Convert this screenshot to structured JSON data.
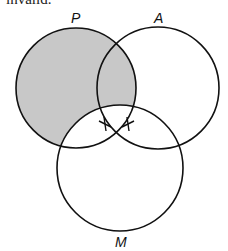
{
  "caption": "invalid.",
  "diagram": {
    "type": "venn",
    "circles": [
      {
        "label": "P",
        "cx": 76,
        "cy": 88,
        "r": 60,
        "shaded": true
      },
      {
        "label": "A",
        "cx": 158,
        "cy": 88,
        "r": 61,
        "shaded": false
      },
      {
        "label": "M",
        "cx": 120,
        "cy": 168,
        "r": 63,
        "shaded": false
      }
    ],
    "shade_color": "#c8c8c8",
    "stroke_color": "#111111",
    "marks": [
      {
        "type": "x",
        "x": 105,
        "y": 124
      },
      {
        "type": "x",
        "x": 128,
        "y": 124
      }
    ],
    "labels": {
      "P": "P",
      "A": "A",
      "M": "M"
    }
  }
}
